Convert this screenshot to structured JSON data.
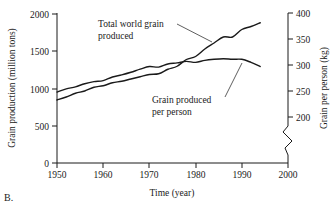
{
  "caption": "B.",
  "chart_data": {
    "type": "line",
    "title": "",
    "xlabel": "Time (year)",
    "ylabel": "Grain production (million tons)",
    "y2label": "Grain per person (kg)",
    "xlim": [
      1950,
      2000
    ],
    "ylim": [
      0,
      2000
    ],
    "y2lim": [
      175,
      400
    ],
    "grid": false,
    "legend_position": "inline-annotations",
    "xticks": [
      1950,
      1960,
      1970,
      1980,
      1990,
      2000
    ],
    "xticklabels": [
      "1950",
      "1960",
      "1970",
      "1980",
      "1990",
      "2000"
    ],
    "yticks": [
      0,
      500,
      1000,
      1500,
      2000
    ],
    "yticklabels": [
      "0",
      "500",
      "1000",
      "1500",
      "2000"
    ],
    "y2ticks": [
      200,
      250,
      300,
      350,
      400
    ],
    "y2ticklabels": [
      "200",
      "250",
      "300",
      "350",
      "400"
    ],
    "y2_axis_break": true,
    "annotations": [
      {
        "name": "total-world-grain-produced",
        "line1": "Total world grain",
        "line2": "produced"
      },
      {
        "name": "grain-produced-per-person",
        "line1": "Grain produced",
        "line2": "per person"
      }
    ],
    "series": [
      {
        "name": "Total world grain produced",
        "axis": "left",
        "units": "million tons",
        "x": [
          1950,
          1952,
          1954,
          1956,
          1958,
          1960,
          1962,
          1964,
          1966,
          1968,
          1970,
          1972,
          1974,
          1976,
          1978,
          1980,
          1982,
          1984,
          1986,
          1988,
          1990,
          1992,
          1994
        ],
        "values": [
          840,
          880,
          930,
          960,
          1010,
          1030,
          1070,
          1090,
          1120,
          1150,
          1180,
          1190,
          1250,
          1290,
          1380,
          1420,
          1520,
          1600,
          1680,
          1680,
          1780,
          1820,
          1870
        ]
      },
      {
        "name": "Grain produced per person",
        "axis": "right",
        "units": "kg",
        "x": [
          1950,
          1952,
          1954,
          1956,
          1958,
          1960,
          1962,
          1964,
          1966,
          1968,
          1970,
          1972,
          1974,
          1976,
          1978,
          1980,
          1982,
          1984,
          1986,
          1988,
          1990,
          1992,
          1994
        ],
        "values": [
          248,
          254,
          258,
          264,
          268,
          270,
          277,
          281,
          286,
          292,
          297,
          296,
          302,
          304,
          307,
          305,
          309,
          311,
          312,
          311,
          311,
          305,
          297
        ]
      }
    ],
    "crossing_year": 1975
  }
}
